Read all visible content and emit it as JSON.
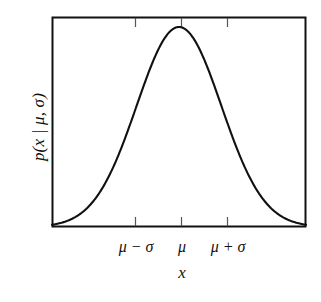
{
  "figure": {
    "kind": "gaussian-density-plot",
    "background_color": "#ffffff",
    "ink_color": "#111111",
    "frame_color": "#111111",
    "curve_color": "#111111"
  },
  "axes": {
    "y_label": "p(x | μ, σ)",
    "x_label": "x",
    "x_tick_labels": [
      "μ − σ",
      "μ",
      "μ + σ"
    ],
    "y_tick_labels": [],
    "frame": {
      "left": 52,
      "right": 306,
      "top": 17,
      "bottom": 227
    },
    "tick_positions_px": [
      135,
      181,
      227
    ],
    "tick_length_px": 8,
    "tick_direction": "inward",
    "ticks_on_borders": [
      "top",
      "bottom"
    ],
    "grid": "off",
    "legend": "none"
  },
  "chart_data": {
    "type": "line",
    "title": "",
    "subtitle": "",
    "xlabel": "x",
    "ylabel": "p(x | μ, σ)",
    "grid": false,
    "legend_position": "none",
    "xlim": [
      -3.0,
      3.0
    ],
    "ylim": [
      0,
      1.05
    ],
    "xticks": [
      -1,
      0,
      1
    ],
    "xticklabels": [
      "μ − σ",
      "μ",
      "μ + σ"
    ],
    "yticks": [],
    "yticklabels": [],
    "annotations": [],
    "series": [
      {
        "name": "Gaussian density",
        "formula": "exp(-x^2 / 2)",
        "mu": 0,
        "sigma": 1,
        "peak_x": 0,
        "peak_y": 1.0,
        "x": [
          -3.0,
          -2.75,
          -2.5,
          -2.25,
          -2.0,
          -1.75,
          -1.5,
          -1.25,
          -1.0,
          -0.75,
          -0.5,
          -0.25,
          0.0,
          0.25,
          0.5,
          0.75,
          1.0,
          1.25,
          1.5,
          1.75,
          2.0,
          2.25,
          2.5,
          2.75,
          3.0
        ],
        "values": [
          0.011,
          0.023,
          0.044,
          0.079,
          0.135,
          0.216,
          0.325,
          0.458,
          0.607,
          0.755,
          0.882,
          0.969,
          1.0,
          0.969,
          0.882,
          0.755,
          0.607,
          0.458,
          0.325,
          0.216,
          0.135,
          0.079,
          0.044,
          0.023,
          0.011
        ]
      }
    ]
  }
}
